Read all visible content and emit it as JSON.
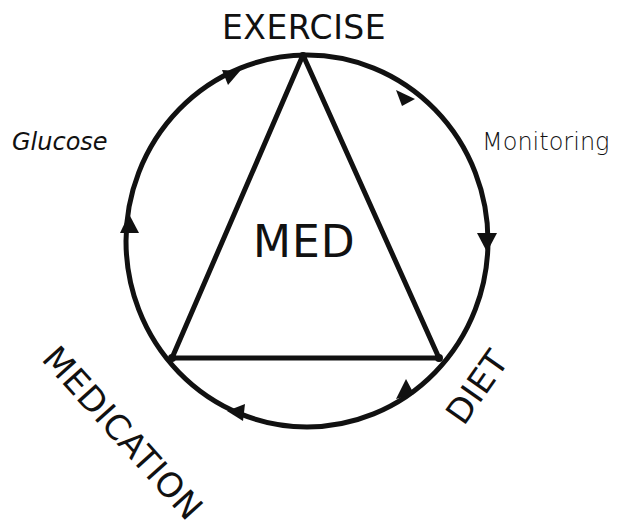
{
  "diagram": {
    "type": "cycle-with-triangle",
    "center_label": "MED",
    "vertices": {
      "top": "EXERCISE",
      "bottom_right": "DIET",
      "bottom_left": "MEDICATION"
    },
    "arc_labels": {
      "right": "Monitoring",
      "left": "Glucose"
    },
    "flow_direction": "clockwise",
    "colors": {
      "stroke": "#111111",
      "background": "#ffffff"
    }
  }
}
